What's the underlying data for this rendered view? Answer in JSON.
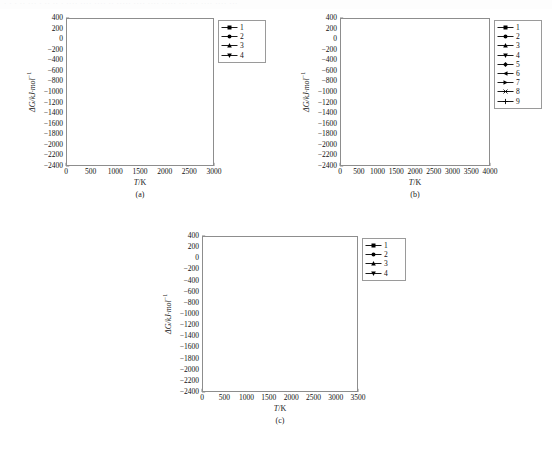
{
  "page": {
    "ghost_header": "· · ·   ·· ···  ·   ·· ··   ·  ···· ···· ···· ·· ····· ···· ···· ·····  ··· ··· ···· ····  ···",
    "axis_label_y": "ΔG/kJ·mol",
    "axis_label_y_sup": "−1",
    "axis_label_x": "T/K",
    "axis_label_x_italic": "T",
    "axis_label_x_rest": "/K"
  },
  "captions": {
    "a": "(a)",
    "b": "(b)",
    "c": "(c)"
  },
  "chart_data": [
    {
      "id": "a",
      "type": "line",
      "title": "(a)",
      "xlabel": "T/K",
      "ylabel": "ΔG/kJ·mol−1",
      "xlim": [
        0,
        3000
      ],
      "ylim": [
        -2400,
        400
      ],
      "xticks": [
        0,
        500,
        1000,
        1500,
        2000,
        2500,
        3000
      ],
      "yticks": [
        400,
        200,
        0,
        -200,
        -400,
        -600,
        -800,
        -1000,
        -1200,
        -1400,
        -1600,
        -1800,
        -2000,
        -2200,
        -2400
      ],
      "grid": false,
      "legend_position": "top-right",
      "series": [
        {
          "name": "1",
          "marker": "square",
          "x": [
            300,
            400,
            500,
            600,
            800,
            1000,
            1200
          ],
          "y": [
            -1755,
            -1765,
            -1790,
            -1815,
            -1865,
            -1925,
            -1975
          ]
        },
        {
          "name": "2",
          "marker": "circle",
          "x": [
            300,
            400,
            600,
            800,
            1000,
            1200,
            1400,
            1600,
            1800,
            2000
          ],
          "y": [
            -1145,
            -1135,
            -1115,
            -1090,
            -1070,
            -1045,
            -1020,
            -1000,
            -965,
            -925
          ]
        },
        {
          "name": "3",
          "marker": "triangle-up",
          "x": [
            300,
            400,
            600,
            800,
            1000,
            1200,
            1400,
            1600,
            1800,
            2000
          ],
          "y": [
            -530,
            -528,
            -512,
            -500,
            -490,
            -478,
            -465,
            -455,
            -442,
            -430
          ]
        },
        {
          "name": "4",
          "marker": "triangle-down",
          "x": [
            300,
            400,
            600,
            800,
            1000,
            1200,
            1400
          ],
          "y": [
            -1760,
            -1745,
            -1745,
            -1705,
            -1675,
            -1640,
            -1610
          ]
        }
      ],
      "legend": [
        "1",
        "2",
        "3",
        "4"
      ]
    },
    {
      "id": "b",
      "type": "line",
      "title": "(b)",
      "xlabel": "T/K",
      "ylabel": "ΔG/kJ·mol−1",
      "xlim": [
        0,
        4000
      ],
      "ylim": [
        -2400,
        400
      ],
      "xticks": [
        0,
        500,
        1000,
        1500,
        2000,
        2500,
        3000,
        3500,
        4000
      ],
      "yticks": [
        400,
        200,
        0,
        -200,
        -400,
        -600,
        -800,
        -1000,
        -1200,
        -1400,
        -1600,
        -1800,
        -2000,
        -2200,
        -2400
      ],
      "grid": false,
      "legend_position": "right",
      "series": [
        {
          "name": "1",
          "marker": "square",
          "x": [
            300,
            400,
            600,
            800,
            1000,
            1200
          ],
          "y": [
            -2010,
            -2005,
            -1995,
            -1980,
            -1965,
            -1960
          ]
        },
        {
          "name": "2",
          "marker": "circle",
          "x": [
            300,
            400,
            600,
            800,
            1000,
            1200,
            1400,
            1600,
            1800,
            2000
          ],
          "y": [
            -995,
            -1000,
            -1030,
            -1050,
            -1060,
            -1060,
            -1050,
            -1035,
            -985,
            -930
          ]
        },
        {
          "name": "3",
          "marker": "triangle-up",
          "x": [
            300,
            400,
            600,
            800,
            1000,
            1200,
            1400,
            1600,
            1800,
            2000
          ],
          "y": [
            -830,
            -835,
            -845,
            -860,
            -880,
            -900,
            -915,
            -925,
            -930,
            -930
          ]
        },
        {
          "name": "4",
          "marker": "triangle-down",
          "x": [
            300,
            400,
            600,
            800,
            1000,
            1200,
            1400,
            1600,
            1800,
            2000,
            2200,
            2400,
            2600,
            2800,
            3000,
            3200
          ],
          "y": [
            -825,
            -818,
            -800,
            -775,
            -745,
            -710,
            -680,
            -600,
            -580,
            -560,
            -540,
            -520,
            -495,
            -470,
            -435,
            -380
          ]
        },
        {
          "name": "5",
          "marker": "diamond",
          "x": [
            300,
            400,
            600,
            800,
            1000,
            1200
          ],
          "y": [
            -1770,
            -1775,
            -1800,
            -1855,
            -1905,
            -1955
          ]
        },
        {
          "name": "6",
          "marker": "triangle-left",
          "x": [
            300,
            400,
            600,
            800,
            1000,
            1200,
            1400,
            1600,
            1800,
            2000
          ],
          "y": [
            -1145,
            -1140,
            -1105,
            -1085,
            -1070,
            -1065,
            -1055,
            -1040,
            -1000,
            -940
          ]
        },
        {
          "name": "7",
          "marker": "triangle-right",
          "x": [
            300,
            400,
            600,
            800,
            1000,
            1200,
            1400,
            1600,
            1800,
            2000
          ],
          "y": [
            -20,
            -18,
            -15,
            -12,
            -10,
            -8,
            -6,
            -5,
            -4,
            -3
          ]
        },
        {
          "name": "8",
          "marker": "star",
          "x": [
            300,
            400,
            600,
            800,
            1000,
            1200,
            1400
          ],
          "y": [
            5,
            25,
            40,
            55,
            80,
            100,
            85
          ]
        },
        {
          "name": "9",
          "marker": "plus",
          "x": [
            300,
            400,
            600,
            800,
            1000,
            1200,
            1400,
            1600,
            1800,
            2000
          ],
          "y": [
            -35,
            -30,
            -25,
            -22,
            -20,
            -18,
            -15,
            -12,
            -10,
            -8
          ]
        }
      ],
      "legend": [
        "1",
        "2",
        "3",
        "4",
        "5",
        "6",
        "7",
        "8",
        "9"
      ]
    },
    {
      "id": "c",
      "type": "line",
      "title": "(c)",
      "xlabel": "T/K",
      "ylabel": "ΔG/kJ·mol−1",
      "xlim": [
        0,
        3500
      ],
      "ylim": [
        -2400,
        400
      ],
      "xticks": [
        0,
        500,
        1000,
        1500,
        2000,
        2500,
        3000,
        3500
      ],
      "yticks": [
        400,
        200,
        0,
        -200,
        -400,
        -600,
        -800,
        -1000,
        -1200,
        -1400,
        -1600,
        -1800,
        -2000,
        -2200,
        -2400
      ],
      "grid": false,
      "legend_position": "top-right",
      "series": [
        {
          "name": "1",
          "marker": "square",
          "x": [
            300,
            400,
            600,
            800,
            1000,
            1200
          ],
          "y": [
            -1720,
            -1700,
            -1685,
            -1655,
            -1650,
            -1625
          ]
        },
        {
          "name": "2",
          "marker": "circle",
          "x": [
            300,
            400,
            600,
            800,
            1000,
            1200,
            1400,
            1600,
            1800,
            2000
          ],
          "y": [
            -1160,
            -1160,
            -1165,
            -1170,
            -1190,
            -1190,
            -1135,
            -1320,
            -1315,
            -1325
          ]
        },
        {
          "name": "3",
          "marker": "triangle-up",
          "x": [
            300,
            400,
            600,
            800,
            1000,
            1200
          ],
          "y": [
            -420,
            -420,
            -425,
            -430,
            -440,
            -450
          ]
        },
        {
          "name": "4",
          "marker": "triangle-down",
          "x": [
            300,
            400,
            600,
            800,
            1000,
            1200,
            1400,
            1600,
            1800,
            2000,
            2200,
            2400,
            2600,
            2800,
            3000
          ],
          "y": [
            -65,
            -70,
            -75,
            -80,
            -110,
            -105,
            -110,
            -115,
            -115,
            -120,
            -60,
            200,
            215,
            -955,
            -1195
          ]
        }
      ],
      "legend": [
        "1",
        "2",
        "3",
        "4"
      ]
    }
  ]
}
